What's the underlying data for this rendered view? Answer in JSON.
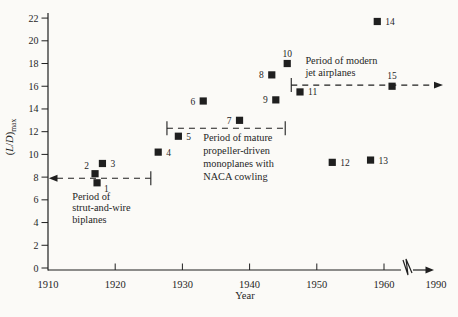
{
  "figure": {
    "width": 458,
    "height": 317,
    "background": "#fbfaf7",
    "ink": "#1f1f1f"
  },
  "chart_data": {
    "type": "scatter",
    "marker": "filled-square",
    "xlabel": "Year",
    "ylabel": "(L/D)max",
    "ylabel_rich": {
      "parts": [
        {
          "t": "(",
          "italic": false
        },
        {
          "t": "L",
          "italic": true
        },
        {
          "t": "/",
          "italic": false
        },
        {
          "t": "D",
          "italic": true
        },
        {
          "t": ")",
          "italic": false
        }
      ],
      "subscript": "max"
    },
    "xlim": [
      1910,
      1968
    ],
    "ylim": [
      0,
      22
    ],
    "grid": false,
    "y_ticks": [
      0,
      2,
      4,
      6,
      8,
      10,
      12,
      14,
      16,
      18,
      20,
      22
    ],
    "x_tick_years": [
      1920,
      1930,
      1940,
      1950,
      1960
    ],
    "x_tick_labels": [
      {
        "text": "1910",
        "year": 1910
      },
      {
        "text": "1920",
        "year": 1920
      },
      {
        "text": "1930",
        "year": 1930
      },
      {
        "text": "1940",
        "year": 1940
      },
      {
        "text": "1950",
        "year": 1950
      },
      {
        "text": "1960",
        "year": 1960
      },
      {
        "text": "1990",
        "px": 436
      }
    ],
    "axis_break": {
      "present": true,
      "between": [
        1963,
        1990
      ],
      "arrow_end": true
    },
    "points": [
      {
        "label": "1",
        "year": 1917.3,
        "ld": 7.5,
        "label_side": "below-right"
      },
      {
        "label": "2",
        "year": 1917.0,
        "ld": 8.3,
        "label_side": "above-left"
      },
      {
        "label": "3",
        "year": 1918.1,
        "ld": 9.2,
        "label_side": "right"
      },
      {
        "label": "4",
        "year": 1926.4,
        "ld": 10.2,
        "label_side": "right"
      },
      {
        "label": "5",
        "year": 1929.4,
        "ld": 11.6,
        "label_side": "right"
      },
      {
        "label": "6",
        "year": 1933.1,
        "ld": 14.7,
        "label_side": "left"
      },
      {
        "label": "7",
        "year": 1938.5,
        "ld": 13.0,
        "label_side": "left"
      },
      {
        "label": "8",
        "year": 1943.3,
        "ld": 17.0,
        "label_side": "left"
      },
      {
        "label": "9",
        "year": 1943.9,
        "ld": 14.8,
        "label_side": "left"
      },
      {
        "label": "10",
        "year": 1945.6,
        "ld": 18.0,
        "label_side": "above"
      },
      {
        "label": "11",
        "year": 1947.5,
        "ld": 15.5,
        "label_side": "right"
      },
      {
        "label": "12",
        "year": 1952.3,
        "ld": 9.3,
        "label_side": "right"
      },
      {
        "label": "13",
        "year": 1958.0,
        "ld": 9.5,
        "label_side": "right"
      },
      {
        "label": "14",
        "year": 1959.0,
        "ld": 21.7,
        "label_side": "right"
      },
      {
        "label": "15",
        "year": 1961.2,
        "ld": 16.0,
        "label_side": "above"
      }
    ],
    "periods": [
      {
        "id": "biplanes",
        "label_lines": [
          "Period of",
          "strut-and-wire",
          "biplanes"
        ],
        "ld": 7.9,
        "start_year": 1910,
        "end_year": 1925.3,
        "left_cap": "arrow",
        "right_cap": "bar",
        "label_anchor": {
          "year": 1913.6,
          "ld": 6.0
        },
        "label_line_height": 11.5
      },
      {
        "id": "propeller",
        "label_lines": [
          "Period of mature",
          "propeller-driven",
          "monoplanes with",
          "NACA cowling"
        ],
        "ld": 12.3,
        "start_year": 1927.7,
        "end_year": 1945.3,
        "left_cap": "bar",
        "right_cap": "bar",
        "label_anchor": {
          "year": 1933.1,
          "ld": 11.2
        },
        "label_line_height": 13
      },
      {
        "id": "jets",
        "label_lines": [
          "Period of modern",
          "jet airplanes"
        ],
        "ld": 16.1,
        "start_year": 1946.2,
        "end_year": null,
        "end_px": 434,
        "left_cap": "bar",
        "right_cap": "arrow",
        "label_anchor": {
          "year": 1948.3,
          "ld": 18.0
        },
        "label_line_height": 12.5
      }
    ]
  }
}
